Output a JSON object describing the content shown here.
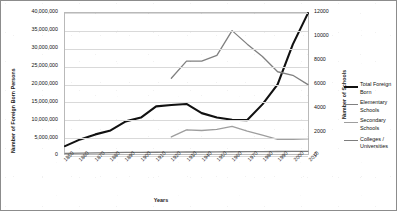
{
  "chart_data": {
    "type": "line",
    "title": "",
    "xlabel": "Years",
    "ylabel": "Number of Foreign Born Persons",
    "ylabel_secondary": "Number of Schools",
    "grid": true,
    "legend_position": "right",
    "x": [
      1850,
      1860,
      1870,
      1880,
      1890,
      1900,
      1910,
      1920,
      1930,
      1940,
      1950,
      1960,
      1970,
      1980,
      1990,
      2000,
      2010
    ],
    "categories": [
      "1850",
      "1860",
      "1870",
      "1880",
      "1890",
      "1900",
      "1910",
      "1920",
      "1930",
      "1940",
      "1950",
      "1960",
      "1970",
      "1980",
      "1990",
      "2000",
      "2010"
    ],
    "ylim": [
      0,
      40000000
    ],
    "yticks": [
      "0",
      "5,000,000",
      "10,000,000",
      "15,000,000",
      "20,000,000",
      "25,000,000",
      "30,000,000",
      "35,000,000",
      "40,000,000"
    ],
    "ylim_secondary": [
      0,
      12000
    ],
    "yticks_secondary": [
      "0",
      "2000",
      "4000",
      "6000",
      "8000",
      "10000",
      "12000"
    ],
    "series": [
      {
        "name": "Total Foreign Born",
        "axis": "left",
        "color": "#111111",
        "width": 2.1,
        "values": [
          2244602,
          4138697,
          5567229,
          6679943,
          9249547,
          10341276,
          13515886,
          13920692,
          14204149,
          11594896,
          10347395,
          9738091,
          9619302,
          14079906,
          19767316,
          31107889,
          39955854
        ]
      },
      {
        "name": "Elementary Schools",
        "axis": "right",
        "color": "#808080",
        "width": 1.3,
        "values": [
          null,
          null,
          null,
          null,
          null,
          null,
          null,
          6450,
          7900,
          7900,
          8400,
          10500,
          9350,
          8300,
          7000,
          6700,
          5900
        ]
      },
      {
        "name": "Secondary Schools",
        "axis": "right",
        "color": "#9e9e9e",
        "width": 1.3,
        "values": [
          null,
          null,
          null,
          null,
          null,
          null,
          null,
          1450,
          2050,
          2000,
          2100,
          2350,
          1950,
          1600,
          1250,
          1250,
          1280
        ]
      },
      {
        "name": "Colleges / Universities",
        "axis": "right",
        "color": "#7d7d7d",
        "width": 1.3,
        "values": [
          60,
          70,
          90,
          110,
          130,
          140,
          150,
          160,
          170,
          170,
          180,
          190,
          200,
          210,
          215,
          220,
          230
        ]
      }
    ]
  },
  "axes": {
    "left_title": "Number of Foreign Born Persons",
    "right_title": "Number of Schools",
    "x_title": "Years"
  },
  "legend": {
    "items": [
      {
        "label": "Total Foreign Born",
        "color": "#111111",
        "thickness": "2.2px"
      },
      {
        "label": "Elementary Schools",
        "color": "#808080",
        "thickness": "1.3px"
      },
      {
        "label": "Secondary Schools",
        "color": "#9e9e9e",
        "thickness": "1.3px"
      },
      {
        "label": "Colleges / Universities",
        "color": "#7d7d7d",
        "thickness": "1.3px"
      }
    ]
  }
}
